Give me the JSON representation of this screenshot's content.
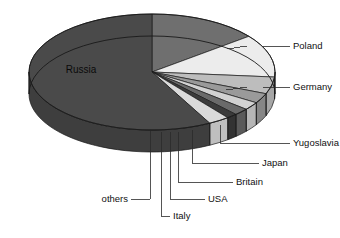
{
  "chart_data": {
    "type": "pie",
    "title": "",
    "subtitle": "",
    "xlabel": "",
    "ylabel": "",
    "legend_position": "none",
    "grid": false,
    "style": "3d-exploded-none",
    "start_angle_deg": 0,
    "direction": "clockwise",
    "categories": [
      "Poland",
      "Germany",
      "Yugoslavia",
      "Japan",
      "Britain",
      "USA",
      "Italy",
      "others",
      "Russia"
    ],
    "values": [
      14.4,
      11.9,
      4.7,
      2.8,
      2.2,
      1.9,
      1.4,
      2.8,
      57.9
    ],
    "unit": "percent",
    "slices": [
      {
        "label": "Poland",
        "value": 14.4,
        "start_deg": 0.0,
        "end_deg": 52.0,
        "color": "#6f6f6f",
        "side_color": "#5e5e5e",
        "label_side": "right"
      },
      {
        "label": "Germany",
        "value": 11.9,
        "start_deg": 52.0,
        "end_deg": 95.0,
        "color": "#ececec",
        "side_color": "#cfcfcf",
        "label_side": "right"
      },
      {
        "label": "Yugoslavia",
        "value": 4.7,
        "start_deg": 95.0,
        "end_deg": 112.0,
        "color": "#bdbdbd",
        "side_color": "#a6a6a6",
        "label_side": "right"
      },
      {
        "label": "Japan",
        "value": 2.8,
        "start_deg": 112.0,
        "end_deg": 122.0,
        "color": "#9a9a9a",
        "side_color": "#868686",
        "label_side": "right"
      },
      {
        "label": "Britain",
        "value": 2.2,
        "start_deg": 122.0,
        "end_deg": 130.0,
        "color": "#d2d2d2",
        "side_color": "#b6b6b6",
        "label_side": "right"
      },
      {
        "label": "USA",
        "value": 1.9,
        "start_deg": 130.0,
        "end_deg": 137.0,
        "color": "#6a6a6a",
        "side_color": "#5a5a5a",
        "label_side": "bottom"
      },
      {
        "label": "Italy",
        "value": 1.4,
        "start_deg": 137.0,
        "end_deg": 142.0,
        "color": "#3b3b3b",
        "side_color": "#333333",
        "label_side": "bottom"
      },
      {
        "label": "others",
        "value": 2.8,
        "start_deg": 142.0,
        "end_deg": 152.0,
        "color": "#dadada",
        "side_color": "#bfbfbf",
        "label_side": "bottom"
      },
      {
        "label": "Russia",
        "value": 57.9,
        "start_deg": 152.0,
        "end_deg": 360.0,
        "color": "#4a4a4a",
        "side_color": "#3e3e3e",
        "label_side": "inside"
      }
    ]
  },
  "labels": {
    "poland": "Poland",
    "germany": "Germany",
    "yugoslavia": "Yugoslavia",
    "japan": "Japan",
    "britain": "Britain",
    "usa": "USA",
    "italy": "Italy",
    "others": "others",
    "russia": "Russia"
  },
  "colors": {
    "background": "#ffffff",
    "text": "#111111",
    "leader_line": "#2b2b2b",
    "slice_outline": "#1a1a1a",
    "russia": "#4a4a4a",
    "poland": "#6f6f6f",
    "germany": "#ececec",
    "yugoslavia": "#bdbdbd",
    "japan": "#9a9a9a",
    "britain": "#d2d2d2",
    "usa": "#6a6a6a",
    "italy": "#3b3b3b",
    "others": "#dadada"
  },
  "geometry": {
    "center_x": 152,
    "center_y": 72,
    "radius_x": 123,
    "radius_y": 58,
    "depth": 22
  }
}
